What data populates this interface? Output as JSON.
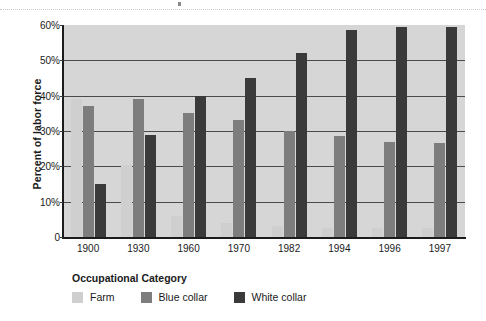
{
  "chart_data": {
    "type": "bar",
    "title": "",
    "xlabel": "",
    "ylabel": "Percent of labor force",
    "ylim": [
      0,
      60
    ],
    "grid": true,
    "legend_position": "bottom-left",
    "legend_title": "Occupational Category",
    "categories": [
      "1900",
      "1930",
      "1960",
      "1970",
      "1982",
      "1994",
      "1996",
      "1997"
    ],
    "ytick_labels": [
      "0",
      "10%",
      "20%",
      "30%",
      "40%",
      "50%",
      "60%"
    ],
    "ytick_values": [
      0,
      10,
      20,
      30,
      40,
      50,
      60
    ],
    "series": [
      {
        "name": "Farm",
        "color": "#cfcfcf",
        "values": [
          39,
          20.5,
          6,
          4,
          3,
          2.5,
          2.5,
          2.5
        ]
      },
      {
        "name": "Blue collar",
        "color": "#7d7d7d",
        "values": [
          37,
          39,
          35,
          33,
          30,
          28.5,
          27,
          26.5
        ]
      },
      {
        "name": "White collar",
        "color": "#3a3a3a",
        "values": [
          15,
          29,
          40,
          45,
          52,
          58.5,
          59.5,
          59.5
        ]
      }
    ]
  },
  "colors": {
    "plot_background": "#d6d6d6",
    "gridline": "#4a4a4a",
    "axis": "#1c1c1c",
    "text": "#1a1a1a"
  }
}
